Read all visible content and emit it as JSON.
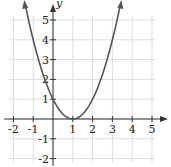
{
  "chart_data": {
    "type": "line",
    "title": "",
    "xlabel": "t",
    "ylabel": "y",
    "xlim": [
      -2,
      5
    ],
    "ylim": [
      -2,
      5
    ],
    "grid": true,
    "x_ticks": [
      "-2",
      "-1",
      "1",
      "2",
      "3",
      "4",
      "5"
    ],
    "y_ticks": [
      "5",
      "4",
      "3",
      "2",
      "1",
      "-1",
      "-2"
    ],
    "series": [
      {
        "name": "y = (t-1)^2",
        "x": [
          -1.4,
          -1,
          -0.5,
          0,
          0.5,
          1,
          1.5,
          2,
          2.5,
          3,
          3.4
        ],
        "values": [
          5.76,
          4,
          2.25,
          1,
          0.25,
          0,
          0.25,
          1,
          2.25,
          4,
          5.76
        ]
      }
    ],
    "colors": {
      "curve": "#555555",
      "grid": "#dddddd",
      "axis": "#333333"
    }
  }
}
